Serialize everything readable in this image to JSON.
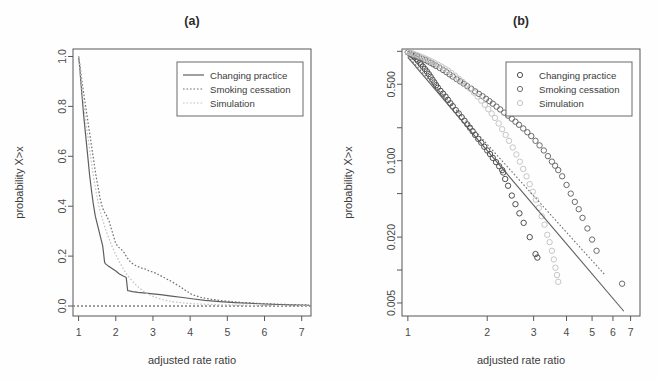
{
  "figure": {
    "panels": [
      {
        "id": "a",
        "title": "(a)",
        "xlabel": "adjusted rate ratio",
        "ylabel": "probability X>x",
        "legend": [
          {
            "label": "Changing practice",
            "style": "solid",
            "color": "#5e5e5e"
          },
          {
            "label": "Smoking cessation",
            "style": "dotted",
            "color": "#6e6e6e"
          },
          {
            "label": "Simulation",
            "style": "dotted",
            "color": "#c2c2c2"
          }
        ]
      },
      {
        "id": "b",
        "title": "(b)",
        "xlabel": "adjusted rate ratio",
        "ylabel": "probability X>x",
        "legend": [
          {
            "label": "Changing practice",
            "style": "circle",
            "color": "#4f4f4f"
          },
          {
            "label": "Smoking cessation",
            "style": "circle",
            "color": "#6b6b6b"
          },
          {
            "label": "Simulation",
            "style": "circle",
            "color": "#c6c6c6"
          }
        ]
      }
    ]
  },
  "chart_data": [
    {
      "type": "line",
      "panel": "a",
      "title": "(a)",
      "xlabel": "adjusted rate ratio",
      "ylabel": "probability X>x",
      "xscale": "linear",
      "yscale": "linear",
      "xlim": [
        0.85,
        7.25
      ],
      "ylim": [
        -0.04,
        1.03
      ],
      "xticks": [
        1,
        2,
        3,
        4,
        5,
        6,
        7
      ],
      "xticklabels": [
        "1",
        "2",
        "3",
        "4",
        "5",
        "6",
        "7"
      ],
      "yticks": [
        0.0,
        0.2,
        0.4,
        0.6,
        0.8,
        1.0
      ],
      "yticklabels": [
        "0.0",
        "0.2",
        "0.4",
        "0.6",
        "0.8",
        "1.0"
      ],
      "grid": false,
      "legend_position": "top-right",
      "reference_lines": [
        {
          "orientation": "horizontal",
          "y": 0.0,
          "style": "dotted",
          "color": "#3c3c3c"
        }
      ],
      "series": [
        {
          "name": "Changing practice",
          "style": "solid",
          "color": "#5e5e5e",
          "x": [
            1.0,
            1.03,
            1.06,
            1.1,
            1.14,
            1.18,
            1.22,
            1.26,
            1.3,
            1.35,
            1.4,
            1.45,
            1.5,
            1.55,
            1.6,
            1.65,
            1.7,
            1.72,
            1.8,
            1.9,
            2.0,
            2.1,
            2.2,
            2.28,
            2.32,
            2.45,
            2.6,
            2.8,
            3.0,
            3.2,
            3.5,
            3.8,
            4.1,
            4.4,
            4.8,
            5.2,
            5.6,
            6.0,
            6.4,
            6.8,
            7.2
          ],
          "y": [
            1.0,
            0.96,
            0.9,
            0.83,
            0.76,
            0.7,
            0.64,
            0.58,
            0.52,
            0.46,
            0.405,
            0.36,
            0.33,
            0.3,
            0.27,
            0.24,
            0.175,
            0.17,
            0.16,
            0.15,
            0.14,
            0.128,
            0.12,
            0.115,
            0.062,
            0.058,
            0.055,
            0.052,
            0.049,
            0.046,
            0.04,
            0.034,
            0.028,
            0.023,
            0.018,
            0.014,
            0.011,
            0.008,
            0.006,
            0.004,
            0.003
          ]
        },
        {
          "name": "Smoking cessation",
          "style": "dotted",
          "color": "#6e6e6e",
          "x": [
            1.0,
            1.05,
            1.1,
            1.16,
            1.22,
            1.28,
            1.34,
            1.4,
            1.46,
            1.52,
            1.58,
            1.64,
            1.7,
            1.76,
            1.82,
            1.9,
            2.0,
            2.08,
            2.16,
            2.22,
            2.3,
            2.4,
            2.5,
            2.6,
            2.7,
            2.8,
            2.9,
            3.0,
            3.1,
            3.2,
            3.35,
            3.5,
            3.7,
            3.9,
            4.05,
            4.3,
            4.6,
            5.0,
            5.4,
            5.9,
            6.4,
            6.9,
            7.2
          ],
          "y": [
            1.0,
            0.95,
            0.89,
            0.83,
            0.77,
            0.71,
            0.65,
            0.59,
            0.53,
            0.48,
            0.43,
            0.395,
            0.375,
            0.36,
            0.34,
            0.3,
            0.25,
            0.235,
            0.225,
            0.215,
            0.195,
            0.175,
            0.165,
            0.158,
            0.152,
            0.148,
            0.14,
            0.136,
            0.13,
            0.122,
            0.11,
            0.098,
            0.08,
            0.06,
            0.046,
            0.034,
            0.026,
            0.019,
            0.014,
            0.01,
            0.007,
            0.005,
            0.004
          ]
        },
        {
          "name": "Simulation",
          "style": "dotted",
          "color": "#c2c2c2",
          "x": [
            1.0,
            1.04,
            1.08,
            1.13,
            1.18,
            1.24,
            1.3,
            1.36,
            1.42,
            1.48,
            1.54,
            1.6,
            1.66,
            1.72,
            1.78,
            1.85,
            1.92,
            2.0,
            2.08,
            2.16,
            2.24,
            2.32,
            2.42,
            2.52,
            2.62,
            2.72,
            2.82,
            2.95,
            3.1,
            3.25,
            3.4,
            3.6,
            3.85,
            4.1,
            4.4,
            4.8,
            5.2,
            5.7,
            6.2,
            6.7,
            7.2
          ],
          "y": [
            1.0,
            0.945,
            0.885,
            0.82,
            0.755,
            0.69,
            0.625,
            0.56,
            0.5,
            0.45,
            0.405,
            0.37,
            0.34,
            0.31,
            0.285,
            0.258,
            0.232,
            0.205,
            0.182,
            0.16,
            0.14,
            0.122,
            0.104,
            0.088,
            0.074,
            0.062,
            0.052,
            0.042,
            0.033,
            0.026,
            0.021,
            0.016,
            0.012,
            0.009,
            0.007,
            0.005,
            0.004,
            0.003,
            0.002,
            0.002,
            0.001
          ]
        }
      ]
    },
    {
      "type": "scatter",
      "panel": "b",
      "title": "(b)",
      "xlabel": "adjusted rate ratio",
      "ylabel": "probability X>x",
      "xscale": "log",
      "yscale": "log",
      "xlim": [
        0.95,
        7.6
      ],
      "ylim": [
        0.0038,
        1.05
      ],
      "xticks": [
        1,
        2,
        3,
        4,
        5,
        6,
        7
      ],
      "xticklabels": [
        "1",
        "2",
        "3",
        "4",
        "5",
        "6",
        "7"
      ],
      "yticks": [
        0.005,
        0.02,
        0.1,
        0.5
      ],
      "yticklabels": [
        "0.005",
        "0.020",
        "0.100",
        "0.500"
      ],
      "yminorticks": [
        0.01,
        0.05,
        0.2,
        1.0
      ],
      "grid": false,
      "legend_position": "top-right",
      "fit_lines": [
        {
          "name": "Changing practice fit",
          "style": "solid",
          "color": "#5e5e5e",
          "x": [
            1.0,
            6.6
          ],
          "y": [
            0.88,
            0.0042
          ]
        },
        {
          "name": "Smoking cessation fit",
          "style": "dotted",
          "color": "#6e6e6e",
          "x": [
            1.0,
            5.6
          ],
          "y": [
            0.9,
            0.009
          ]
        }
      ],
      "series": [
        {
          "name": "Changing practice",
          "style": "circle",
          "color": "#4f4f4f",
          "x": [
            1.0,
            1.02,
            1.03,
            1.05,
            1.06,
            1.08,
            1.09,
            1.11,
            1.12,
            1.14,
            1.16,
            1.18,
            1.2,
            1.22,
            1.24,
            1.26,
            1.28,
            1.3,
            1.33,
            1.36,
            1.39,
            1.42,
            1.45,
            1.48,
            1.52,
            1.56,
            1.6,
            1.64,
            1.68,
            1.72,
            1.76,
            1.8,
            1.85,
            1.9,
            1.95,
            2.0,
            2.05,
            2.1,
            2.16,
            2.22,
            2.28,
            2.3,
            2.34,
            2.4,
            2.48,
            2.56,
            2.65,
            2.75,
            2.9,
            3.05,
            3.1
          ],
          "y": [
            0.98,
            0.955,
            0.93,
            0.905,
            0.88,
            0.85,
            0.82,
            0.79,
            0.76,
            0.725,
            0.69,
            0.655,
            0.62,
            0.585,
            0.55,
            0.52,
            0.49,
            0.465,
            0.435,
            0.41,
            0.385,
            0.36,
            0.335,
            0.315,
            0.29,
            0.27,
            0.25,
            0.232,
            0.215,
            0.2,
            0.186,
            0.172,
            0.158,
            0.146,
            0.134,
            0.124,
            0.115,
            0.106,
            0.097,
            0.089,
            0.082,
            0.078,
            0.068,
            0.059,
            0.048,
            0.04,
            0.033,
            0.027,
            0.02,
            0.014,
            0.013
          ]
        },
        {
          "name": "Smoking cessation",
          "style": "circle",
          "color": "#6b6b6b",
          "x": [
            1.0,
            1.02,
            1.04,
            1.06,
            1.08,
            1.1,
            1.13,
            1.16,
            1.19,
            1.22,
            1.25,
            1.28,
            1.32,
            1.36,
            1.4,
            1.44,
            1.48,
            1.53,
            1.58,
            1.63,
            1.68,
            1.74,
            1.8,
            1.86,
            1.92,
            1.98,
            2.04,
            2.1,
            2.17,
            2.24,
            2.32,
            2.4,
            2.48,
            2.56,
            2.64,
            2.74,
            2.84,
            2.94,
            3.05,
            3.16,
            3.28,
            3.4,
            3.52,
            3.62,
            3.72,
            3.85,
            4.0,
            4.15,
            4.3,
            4.45,
            4.6,
            4.8,
            5.0,
            5.2,
            6.5
          ],
          "y": [
            0.985,
            0.965,
            0.945,
            0.925,
            0.905,
            0.885,
            0.86,
            0.835,
            0.81,
            0.785,
            0.76,
            0.735,
            0.705,
            0.675,
            0.645,
            0.615,
            0.588,
            0.558,
            0.53,
            0.505,
            0.48,
            0.455,
            0.43,
            0.408,
            0.388,
            0.368,
            0.35,
            0.332,
            0.312,
            0.294,
            0.275,
            0.258,
            0.242,
            0.227,
            0.213,
            0.197,
            0.182,
            0.168,
            0.152,
            0.138,
            0.124,
            0.11,
            0.098,
            0.09,
            0.082,
            0.072,
            0.06,
            0.05,
            0.042,
            0.036,
            0.03,
            0.024,
            0.019,
            0.015,
            0.0075
          ]
        },
        {
          "name": "Simulation",
          "style": "circle",
          "color": "#c6c6c6",
          "x": [
            1.0,
            1.02,
            1.04,
            1.06,
            1.09,
            1.11,
            1.14,
            1.17,
            1.2,
            1.23,
            1.26,
            1.3,
            1.34,
            1.38,
            1.42,
            1.46,
            1.51,
            1.56,
            1.61,
            1.66,
            1.72,
            1.78,
            1.84,
            1.9,
            1.96,
            2.02,
            2.08,
            2.14,
            2.21,
            2.28,
            2.35,
            2.42,
            2.5,
            2.58,
            2.66,
            2.74,
            2.82,
            2.9,
            2.98,
            3.06,
            3.14,
            3.22,
            3.3,
            3.38,
            3.45,
            3.52,
            3.58,
            3.63,
            3.68,
            3.72
          ],
          "y": [
            0.99,
            0.972,
            0.955,
            0.938,
            0.918,
            0.9,
            0.878,
            0.855,
            0.832,
            0.808,
            0.785,
            0.755,
            0.725,
            0.695,
            0.665,
            0.635,
            0.598,
            0.562,
            0.527,
            0.494,
            0.456,
            0.42,
            0.386,
            0.354,
            0.324,
            0.296,
            0.27,
            0.246,
            0.219,
            0.194,
            0.172,
            0.152,
            0.132,
            0.114,
            0.098,
            0.084,
            0.072,
            0.061,
            0.052,
            0.044,
            0.037,
            0.031,
            0.026,
            0.021,
            0.018,
            0.015,
            0.0125,
            0.0105,
            0.009,
            0.0078
          ]
        }
      ]
    }
  ]
}
